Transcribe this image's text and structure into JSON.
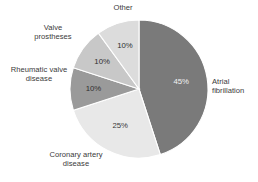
{
  "chart_data": {
    "type": "pie",
    "title": "",
    "subtitle": "",
    "xlabel": "",
    "ylabel": "",
    "legend_position": "none",
    "grid": false,
    "value_unit": "%",
    "total": 100,
    "start_angle_deg": 0,
    "direction": "clockwise",
    "categories": [
      "Atrial fibrillation",
      "Coronary artery disease",
      "Rheumatic valve disease",
      "Valve prostheses",
      "Other"
    ],
    "values": [
      45,
      25,
      10,
      10,
      10
    ],
    "labels": [
      "45%",
      "25%",
      "10%",
      "10%",
      "10%"
    ],
    "colors": [
      "#7a7a7a",
      "#e8e8e8",
      "#9a9a9a",
      "#c8c8c8",
      "#dcdcdc"
    ],
    "slices": [
      {
        "name": "Atrial fibrillation",
        "label": "Atrial\nfibrillation",
        "value": 45,
        "value_label": "45%",
        "color": "#7a7a7a",
        "value_text_color": "#f2f2f2"
      },
      {
        "name": "Coronary artery disease",
        "label": "Coronary artery\ndisease",
        "value": 25,
        "value_label": "25%",
        "color": "#e8e8e8",
        "value_text_color": "#3a3a3a"
      },
      {
        "name": "Rheumatic valve disease",
        "label": "Rheumatic valve\ndisease",
        "value": 10,
        "value_label": "10%",
        "color": "#9a9a9a",
        "value_text_color": "#2f2f2f"
      },
      {
        "name": "Valve prostheses",
        "label": "Valve\nprostheses",
        "value": 10,
        "value_label": "10%",
        "color": "#c8c8c8",
        "value_text_color": "#2f2f2f"
      },
      {
        "name": "Other",
        "label": "Other",
        "value": 10,
        "value_label": "10%",
        "color": "#dcdcdc",
        "value_text_color": "#2f2f2f"
      }
    ],
    "text_color": "#3a3a3a",
    "background_color": "#ffffff"
  }
}
